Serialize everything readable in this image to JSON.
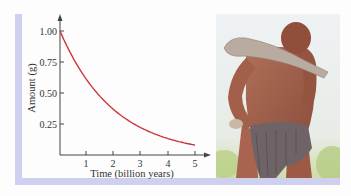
{
  "chart_data": {
    "type": "line",
    "title": "",
    "xlabel": "Time (billion years)",
    "ylabel": "Amount (g)",
    "xlim": [
      0,
      5.5
    ],
    "ylim": [
      0,
      1.1
    ],
    "x_ticks": [
      "1",
      "2",
      "3",
      "4",
      "5"
    ],
    "y_ticks": [
      "0.25",
      "0.50",
      "0.75",
      "1.00"
    ],
    "grid": false,
    "legend": null,
    "series": [
      {
        "name": "Amount remaining",
        "color": "#d0343c",
        "x": [
          0,
          0.5,
          1,
          1.5,
          2,
          2.5,
          3,
          3.5,
          4,
          4.5,
          5
        ],
        "y": [
          1.0,
          0.78,
          0.61,
          0.47,
          0.37,
          0.29,
          0.22,
          0.17,
          0.14,
          0.11,
          0.08
        ]
      }
    ]
  },
  "axes": {
    "x_label": "Time (billion years)",
    "y_label": "Amount (g)",
    "x_tick_labels": [
      "1",
      "2",
      "3",
      "4",
      "5"
    ],
    "y_tick_labels": [
      "1.00",
      "0.75",
      "0.50",
      "0.25"
    ]
  },
  "illustration": {
    "description": "Painted illustration of an early human carrying a wooden club over the shoulder, wearing a hide loincloth"
  },
  "colors": {
    "curve": "#d0343c",
    "frame": "#cfcff0",
    "axis": "#444444"
  }
}
